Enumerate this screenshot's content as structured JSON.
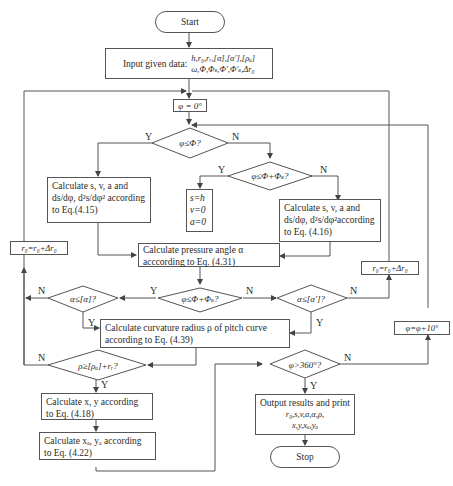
{
  "flowchart": {
    "start": "Start",
    "stop": "Stop",
    "input": {
      "label": "Input given data:",
      "line1": "h,r₀,rᵣ,[α],[α′],[ρₐ]",
      "line2": "ω,Φ,Φₛ,Φ′,Φ′ₛ,Δr₀"
    },
    "init_phi": "φ = 0°",
    "decision_phi_le_Phi": "φ≤Φ?",
    "decision_phi_le_Phi_Phis": "φ≤Φ+Φₛ?",
    "calc_rise": {
      "line1": "Calculate s, v, a and",
      "line2": "ds/dφ, d²s/dφ² according",
      "line3": "to Eq.(4.15)"
    },
    "dwell": {
      "line1": "s=h",
      "line2": "v=0",
      "line3": "a=0"
    },
    "calc_return": {
      "line1": "Calculate s, v, a and",
      "line2": "ds/dφ, d²s/dφ²according",
      "line3": "to Eq.  (4.16)"
    },
    "calc_pressure": {
      "line1": "Calculate pressure angle α",
      "line2": "acccording to Eq. (4.31)"
    },
    "r0_update_left": "r₀=r₀+Δr₀",
    "r0_update_right": "r₀=r₀+Δr₀",
    "decision_alpha_le_alpha": "α≤[α]?",
    "decision_phi_le_Phi_Phis_2": "φ≤Φ+Φₛ?",
    "decision_alpha_le_alpha_prime": "α≤[α′]?",
    "calc_curvature": {
      "line1": "Calculate curvature radius ρ of pitch curve",
      "line2": "according to Eq. (4.39)"
    },
    "decision_rho": "ρ≥[ρₐ]+rᵣ?",
    "phi_increment": "φ=φ+10°",
    "decision_phi_gt_360": "φ>360°?",
    "calc_xy": {
      "line1": "Calculate x,  y according",
      "line2": "to Eq. (4.18)"
    },
    "calc_xa_ya": {
      "line1": "Calculate xₐ,  yₐ according",
      "line2": "to Eq. (4.22)"
    },
    "output": {
      "line1": "Output results and print",
      "line2": "r₀,s,v,a,α,ρ,",
      "line3": "x,y,xₐ,yₐ"
    },
    "labels": {
      "yes": "Y",
      "no": "N"
    }
  },
  "colors": {
    "line": "#555555",
    "text": "#2a2a2a",
    "background": "#ffffff"
  }
}
